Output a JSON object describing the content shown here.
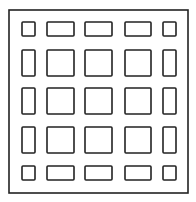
{
  "diagram": {
    "type": "grid-layout",
    "colors": {
      "stroke": "#222222",
      "background": "#ffffff"
    },
    "frame": {
      "x": 9,
      "y": 10,
      "w": 179,
      "h": 183
    },
    "columns": [
      {
        "x": 22,
        "w": 13
      },
      {
        "x": 47,
        "w": 27
      },
      {
        "x": 85,
        "w": 27
      },
      {
        "x": 125,
        "w": 26
      },
      {
        "x": 163,
        "w": 13
      }
    ],
    "rows": [
      {
        "y": 22,
        "h": 14
      },
      {
        "y": 50,
        "h": 26
      },
      {
        "y": 88,
        "h": 26
      },
      {
        "y": 127,
        "h": 26
      },
      {
        "y": 166,
        "h": 14
      }
    ]
  }
}
